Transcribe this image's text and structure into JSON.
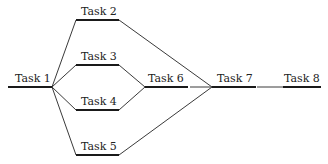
{
  "diagram": {
    "type": "task-dependency network",
    "colors": {
      "line": "#1a1a1a",
      "connector": "#3a3a3a",
      "text": "#222222",
      "background": "#ffffff"
    },
    "tasks": [
      {
        "id": "t1",
        "label": "Task 1"
      },
      {
        "id": "t2",
        "label": "Task 2"
      },
      {
        "id": "t3",
        "label": "Task 3"
      },
      {
        "id": "t4",
        "label": "Task 4"
      },
      {
        "id": "t5",
        "label": "Task 5"
      },
      {
        "id": "t6",
        "label": "Task 6"
      },
      {
        "id": "t7",
        "label": "Task 7"
      },
      {
        "id": "t8",
        "label": "Task 8"
      }
    ],
    "edges": [
      {
        "from": "Task 1",
        "to": "Task 2"
      },
      {
        "from": "Task 1",
        "to": "Task 3"
      },
      {
        "from": "Task 1",
        "to": "Task 4"
      },
      {
        "from": "Task 1",
        "to": "Task 5"
      },
      {
        "from": "Task 3",
        "to": "Task 6"
      },
      {
        "from": "Task 4",
        "to": "Task 6"
      },
      {
        "from": "Task 2",
        "to": "Task 7"
      },
      {
        "from": "Task 6",
        "to": "Task 7"
      },
      {
        "from": "Task 5",
        "to": "Task 7"
      },
      {
        "from": "Task 7",
        "to": "Task 8"
      }
    ]
  }
}
